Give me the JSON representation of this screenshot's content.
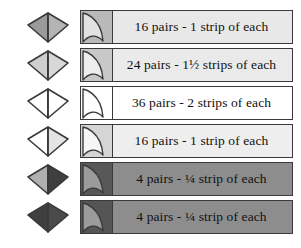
{
  "figure": {
    "type": "fabric-requirement-legend",
    "background": "#ffffff",
    "outline_color": "#3a3a3a",
    "rows": [
      {
        "id": "row-1",
        "label": "16 pairs - 1 strip of each",
        "pairs": 16,
        "strips": "1 strip of each",
        "kite_left_color": "#9a9a9a",
        "kite_right_color": "#b4b4b4",
        "bar_fill": "#e8e8e8",
        "swatch_fill": "#b9b9b9",
        "petal_fill": "#e2e2e2"
      },
      {
        "id": "row-2",
        "label": "24 pairs - 1½ strips of each",
        "pairs": 24,
        "strips": "1½ strips of each",
        "kite_left_color": "#cfcfcf",
        "kite_right_color": "#d8d8d8",
        "bar_fill": "#eaeaea",
        "swatch_fill": "#c8c8c8",
        "petal_fill": "#ededed"
      },
      {
        "id": "row-3",
        "label": "36 pairs - 2 strips of each",
        "pairs": 36,
        "strips": "2 strips of each",
        "kite_left_color": "#ffffff",
        "kite_right_color": "#ffffff",
        "bar_fill": "#ffffff",
        "swatch_fill": "#ffffff",
        "petal_fill": "#ffffff"
      },
      {
        "id": "row-4",
        "label": "16 pairs - 1 strip of each",
        "pairs": 16,
        "strips": "1 strip of each",
        "kite_left_color": "#ffffff",
        "kite_right_color": "#e4e4e4",
        "bar_fill": "#eeeeee",
        "swatch_fill": "#d5d5d5",
        "petal_fill": "#f6f6f6"
      },
      {
        "id": "row-5",
        "label": "4 pairs - ¼ strip of each",
        "pairs": 4,
        "strips": "¼ strip of each",
        "kite_left_color": "#b0b0b0",
        "kite_right_color": "#3f3f3f",
        "bar_fill": "#8d8d8d",
        "swatch_fill": "#585858",
        "petal_fill": "#9b9b9b"
      },
      {
        "id": "row-6",
        "label": "4 pairs - ¼ strip of each",
        "pairs": 4,
        "strips": "¼ strip of each",
        "kite_left_color": "#3f3f3f",
        "kite_right_color": "#4a4a4a",
        "bar_fill": "#8d8d8d",
        "swatch_fill": "#555555",
        "petal_fill": "#9b9b9b"
      }
    ]
  }
}
